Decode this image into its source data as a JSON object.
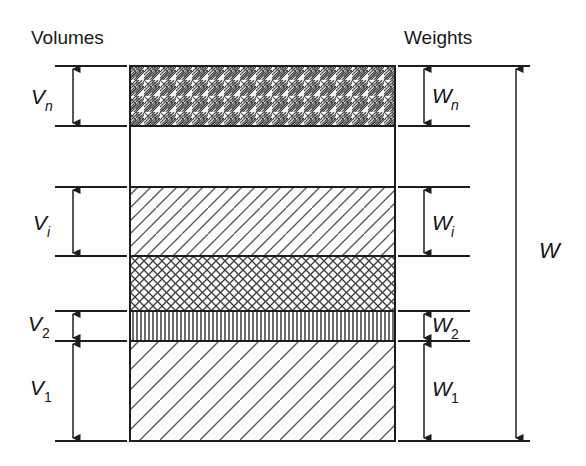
{
  "figure": {
    "background_color": "#ffffff",
    "line_color": "#1d1d1d"
  },
  "headers": {
    "left": "Volumes",
    "right": "Weights"
  },
  "volume_labels": [
    {
      "id": "Vn",
      "base": "V",
      "subscript": "n",
      "subscript_style": "italic"
    },
    {
      "id": "Vi",
      "base": "V",
      "subscript": "i",
      "subscript_style": "italic"
    },
    {
      "id": "V2",
      "base": "V",
      "subscript": "2",
      "subscript_style": "normal"
    },
    {
      "id": "V1",
      "base": "V",
      "subscript": "1",
      "subscript_style": "normal"
    }
  ],
  "weight_labels": [
    {
      "id": "Wn",
      "base": "W",
      "subscript": "n",
      "subscript_style": "italic"
    },
    {
      "id": "Wi",
      "base": "W",
      "subscript": "i",
      "subscript_style": "italic"
    },
    {
      "id": "W2",
      "base": "W",
      "subscript": "2",
      "subscript_style": "normal"
    },
    {
      "id": "W1",
      "base": "W",
      "subscript": "1",
      "subscript_style": "normal"
    }
  ],
  "total_label": {
    "id": "W",
    "base": "W",
    "subscript": ""
  },
  "bands": [
    {
      "name": "band-n",
      "pattern": "basket-weave-hatch",
      "y_top": 66,
      "y_bottom": 126
    },
    {
      "name": "band-void",
      "pattern": "blank",
      "y_top": 126,
      "y_bottom": 187
    },
    {
      "name": "band-i",
      "pattern": "wide-diagonal-hatch",
      "y_top": 187,
      "y_bottom": 256
    },
    {
      "name": "band-mid",
      "pattern": "fine-diamond-crosshatch",
      "y_top": 256,
      "y_bottom": 311
    },
    {
      "name": "band-2",
      "pattern": "vertical-line-hatch",
      "y_top": 311,
      "y_bottom": 341
    },
    {
      "name": "band-1",
      "pattern": "extra-wide-diagonal-hatch",
      "y_top": 341,
      "y_bottom": 441
    }
  ],
  "dimensions": {
    "Vn": {
      "top": 66,
      "bottom": 126
    },
    "Vi": {
      "top": 187,
      "bottom": 256
    },
    "V2": {
      "top": 311,
      "bottom": 341
    },
    "V1": {
      "top": 341,
      "bottom": 441
    },
    "Wn": {
      "top": 66,
      "bottom": 126
    },
    "Wi": {
      "top": 187,
      "bottom": 256
    },
    "W2": {
      "top": 311,
      "bottom": 341
    },
    "W1": {
      "top": 341,
      "bottom": 441
    },
    "W": {
      "top": 66,
      "bottom": 441
    }
  }
}
